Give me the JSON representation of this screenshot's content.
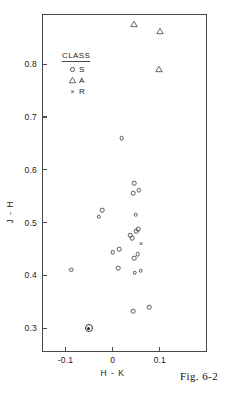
{
  "caption": "Fig. 6-2",
  "legend": {
    "title": "CLASS",
    "entries": [
      {
        "symbol": "circle-marker",
        "label": "S"
      },
      {
        "symbol": "triangle-marker",
        "label": "A"
      },
      {
        "symbol": "cross-marker",
        "label": "R"
      }
    ]
  },
  "axes": {
    "x_ticklabels": [
      "-0.1",
      "0",
      "0.1"
    ],
    "y_ticklabels": [
      "0.3",
      "0.4",
      "0.5",
      "0.6",
      "0.7",
      "0.8"
    ]
  },
  "chart_data": {
    "type": "scatter",
    "title": "",
    "xlabel": "H - K",
    "ylabel": "J - H",
    "xlim": [
      -0.15,
      0.2
    ],
    "ylim": [
      0.255,
      0.895
    ],
    "xticks": [
      -0.1,
      0.0,
      0.1
    ],
    "yticks": [
      0.3,
      0.4,
      0.5,
      0.6,
      0.7,
      0.8
    ],
    "grid": false,
    "legend_position": "upper-left-inside",
    "series": [
      {
        "name": "S",
        "marker": "circle",
        "points": [
          [
            -0.088,
            0.411
          ],
          [
            -0.03,
            0.511
          ],
          [
            -0.022,
            0.524
          ],
          [
            0.0,
            0.444
          ],
          [
            0.014,
            0.45
          ],
          [
            0.012,
            0.414
          ],
          [
            0.019,
            0.66
          ],
          [
            0.037,
            0.476
          ],
          [
            0.041,
            0.47
          ],
          [
            0.045,
            0.575
          ],
          [
            0.044,
            0.556
          ],
          [
            0.046,
            0.433
          ],
          [
            0.047,
            0.405
          ],
          [
            0.049,
            0.515
          ],
          [
            0.05,
            0.484
          ],
          [
            0.054,
            0.487
          ],
          [
            0.053,
            0.44
          ],
          [
            0.055,
            0.561
          ],
          [
            0.059,
            0.409
          ],
          [
            0.044,
            0.332
          ],
          [
            0.077,
            0.34
          ]
        ]
      },
      {
        "name": "A",
        "marker": "triangle",
        "points": [
          [
            0.046,
            0.876
          ],
          [
            0.1,
            0.862
          ],
          [
            0.099,
            0.791
          ]
        ]
      },
      {
        "name": "R",
        "marker": "cross",
        "points": [
          [
            0.06,
            0.461
          ]
        ]
      },
      {
        "name": "highlighted",
        "marker": "circled-dot",
        "points": [
          [
            -0.051,
            0.3
          ]
        ]
      }
    ]
  }
}
